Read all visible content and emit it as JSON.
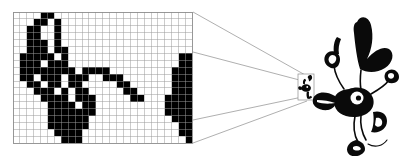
{
  "figure": {
    "background_color": "#ffffff",
    "ink_color": "#000000",
    "grid_line_color": "#9a9a9a",
    "guide_line_color": "#8d8d8d"
  },
  "pixel_grid": {
    "label": "magnified-pixel-grid",
    "columns": 26,
    "rows": 19,
    "cell_size": 6.9,
    "origin_x": 13,
    "origin_y": 12,
    "on_color": "#000000",
    "off_color": "#ffffff",
    "on_cells": [
      [
        4,
        0
      ],
      [
        5,
        0
      ],
      [
        3,
        1
      ],
      [
        4,
        1
      ],
      [
        6,
        1
      ],
      [
        2,
        2
      ],
      [
        3,
        2
      ],
      [
        6,
        2
      ],
      [
        2,
        3
      ],
      [
        3,
        3
      ],
      [
        6,
        3
      ],
      [
        2,
        4
      ],
      [
        3,
        4
      ],
      [
        4,
        4
      ],
      [
        6,
        4
      ],
      [
        2,
        5
      ],
      [
        3,
        5
      ],
      [
        4,
        5
      ],
      [
        6,
        5
      ],
      [
        7,
        5
      ],
      [
        1,
        6
      ],
      [
        2,
        6
      ],
      [
        3,
        6
      ],
      [
        4,
        6
      ],
      [
        5,
        6
      ],
      [
        7,
        6
      ],
      [
        24,
        6
      ],
      [
        25,
        6
      ],
      [
        1,
        7
      ],
      [
        2,
        7
      ],
      [
        3,
        7
      ],
      [
        5,
        7
      ],
      [
        6,
        7
      ],
      [
        7,
        7
      ],
      [
        24,
        7
      ],
      [
        25,
        7
      ],
      [
        1,
        8
      ],
      [
        2,
        8
      ],
      [
        3,
        8
      ],
      [
        4,
        8
      ],
      [
        5,
        8
      ],
      [
        6,
        8
      ],
      [
        7,
        8
      ],
      [
        8,
        8
      ],
      [
        10,
        8
      ],
      [
        11,
        8
      ],
      [
        12,
        8
      ],
      [
        13,
        8
      ],
      [
        23,
        8
      ],
      [
        24,
        8
      ],
      [
        25,
        8
      ],
      [
        1,
        9
      ],
      [
        2,
        9
      ],
      [
        4,
        9
      ],
      [
        5,
        9
      ],
      [
        6,
        9
      ],
      [
        8,
        9
      ],
      [
        9,
        9
      ],
      [
        10,
        9
      ],
      [
        13,
        9
      ],
      [
        14,
        9
      ],
      [
        15,
        9
      ],
      [
        23,
        9
      ],
      [
        24,
        9
      ],
      [
        25,
        9
      ],
      [
        2,
        10
      ],
      [
        3,
        10
      ],
      [
        5,
        10
      ],
      [
        6,
        10
      ],
      [
        8,
        10
      ],
      [
        9,
        10
      ],
      [
        15,
        10
      ],
      [
        16,
        10
      ],
      [
        23,
        10
      ],
      [
        24,
        10
      ],
      [
        25,
        10
      ],
      [
        3,
        11
      ],
      [
        4,
        11
      ],
      [
        5,
        11
      ],
      [
        7,
        11
      ],
      [
        9,
        11
      ],
      [
        10,
        11
      ],
      [
        16,
        11
      ],
      [
        17,
        11
      ],
      [
        23,
        11
      ],
      [
        24,
        11
      ],
      [
        25,
        11
      ],
      [
        4,
        12
      ],
      [
        5,
        12
      ],
      [
        6,
        12
      ],
      [
        7,
        12
      ],
      [
        9,
        12
      ],
      [
        10,
        12
      ],
      [
        11,
        12
      ],
      [
        17,
        12
      ],
      [
        18,
        12
      ],
      [
        22,
        12
      ],
      [
        23,
        12
      ],
      [
        24,
        12
      ],
      [
        25,
        12
      ],
      [
        5,
        13
      ],
      [
        6,
        13
      ],
      [
        7,
        13
      ],
      [
        8,
        13
      ],
      [
        10,
        13
      ],
      [
        11,
        13
      ],
      [
        22,
        13
      ],
      [
        23,
        13
      ],
      [
        24,
        13
      ],
      [
        25,
        13
      ],
      [
        5,
        14
      ],
      [
        6,
        14
      ],
      [
        7,
        14
      ],
      [
        8,
        14
      ],
      [
        9,
        14
      ],
      [
        10,
        14
      ],
      [
        11,
        14
      ],
      [
        22,
        14
      ],
      [
        23,
        14
      ],
      [
        24,
        14
      ],
      [
        25,
        14
      ],
      [
        5,
        15
      ],
      [
        6,
        15
      ],
      [
        7,
        15
      ],
      [
        8,
        15
      ],
      [
        9,
        15
      ],
      [
        10,
        15
      ],
      [
        23,
        15
      ],
      [
        24,
        15
      ],
      [
        25,
        15
      ],
      [
        5,
        16
      ],
      [
        6,
        16
      ],
      [
        7,
        16
      ],
      [
        8,
        16
      ],
      [
        9,
        16
      ],
      [
        10,
        16
      ],
      [
        24,
        16
      ],
      [
        25,
        16
      ],
      [
        6,
        17
      ],
      [
        7,
        17
      ],
      [
        8,
        17
      ],
      [
        9,
        17
      ],
      [
        24,
        17
      ],
      [
        25,
        17
      ],
      [
        7,
        18
      ],
      [
        8,
        18
      ],
      [
        9,
        18
      ],
      [
        25,
        18
      ]
    ]
  },
  "perspective": {
    "label": "perspective-guide-lines",
    "source_edge_x": 193,
    "target_x": 305,
    "lines": [
      {
        "from": [
          193,
          12
        ],
        "to": [
          307,
          76
        ]
      },
      {
        "from": [
          193,
          52
        ],
        "to": [
          307,
          82
        ]
      },
      {
        "from": [
          193,
          140
        ],
        "to": [
          307,
          100
        ]
      },
      {
        "from": [
          193,
          120
        ],
        "to": [
          307,
          95
        ]
      }
    ]
  },
  "thumbnail": {
    "label": "thumbnail-of-character",
    "x": 298,
    "y": 74,
    "width": 16,
    "height": 26
  },
  "character": {
    "label": "cartoon-character",
    "name": "cartoon-duck-figure",
    "x": 315,
    "y": 18,
    "width": 85,
    "height": 120,
    "parts": [
      "head-crest",
      "head",
      "beak",
      "eye",
      "raised-arm",
      "hand-pointing",
      "torso",
      "leg",
      "foot",
      "tail"
    ]
  }
}
